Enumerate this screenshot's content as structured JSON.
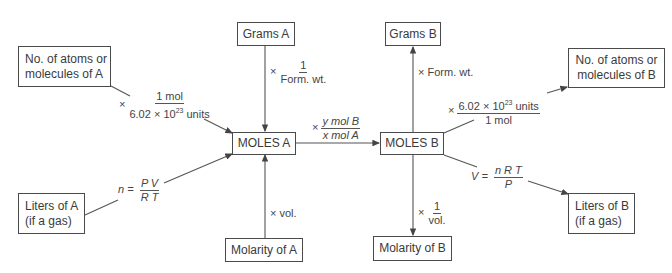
{
  "boxes": {
    "atoms_a": {
      "line1": "No. of atoms or",
      "line2": "molecules of A"
    },
    "grams_a": {
      "label": "Grams A"
    },
    "moles_a": {
      "label": "MOLES A"
    },
    "liters_a": {
      "line1": "Liters of A",
      "line2": "(if a gas)"
    },
    "molarity_a": {
      "label": "Molarity of A"
    },
    "grams_b": {
      "label": "Grams B"
    },
    "moles_b": {
      "label": "MOLES B"
    },
    "atoms_b": {
      "line1": "No. of atoms or",
      "line2": "molecules of B"
    },
    "liters_b": {
      "line1": "Liters of B",
      "line2": "(if a gas)"
    },
    "molarity_b": {
      "label": "Molarity of B"
    }
  },
  "conversions": {
    "atoms_to_moles_a": {
      "prefix": "×",
      "num": "1 mol",
      "den_base": "6.02 × 10",
      "den_exp": "23",
      "den_unit": " units"
    },
    "grams_to_moles_a": {
      "prefix": "×",
      "num": "1",
      "den": "Form. wt."
    },
    "moles_a_to_b": {
      "prefix": "×",
      "num": "y mol B",
      "den": "x mol A"
    },
    "gas_to_moles_a": {
      "lhs": "n =",
      "num": "P V",
      "den": "R T"
    },
    "molarity_to_moles_a": {
      "text": "× vol."
    },
    "moles_to_grams_b": {
      "text": "× Form. wt."
    },
    "moles_to_atoms_b": {
      "prefix": "×",
      "num_base": "6.02 × 10",
      "num_exp": "23",
      "num_unit": " units",
      "den": "1 mol"
    },
    "moles_to_gas_b": {
      "lhs": "V =",
      "num": "n R T",
      "den": "P"
    },
    "moles_to_molarity_b": {
      "prefix": "×",
      "num": "1",
      "den": "vol."
    }
  }
}
